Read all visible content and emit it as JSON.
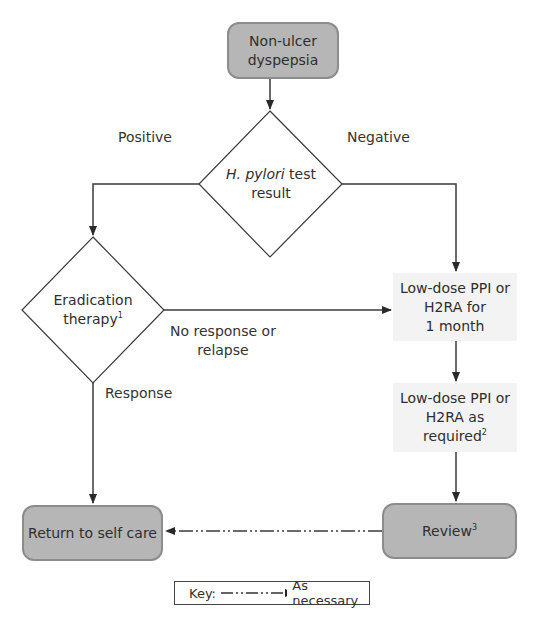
{
  "nodes": {
    "start": {
      "line1": "Non-ulcer",
      "line2": "dyspepsia"
    },
    "hpylori": {
      "italic": "H. pylori",
      "rest": " test",
      "line2": "result"
    },
    "eradication": {
      "line1": "Eradication",
      "line2": "therapy",
      "sup": "1"
    },
    "ppi_month": {
      "line1": "Low-dose PPI or",
      "line2": "H2RA for",
      "line3": "1 month"
    },
    "ppi_required": {
      "line1": "Low-dose PPI or",
      "line2": "H2RA as",
      "line3": "required",
      "sup": "2"
    },
    "return": {
      "label": "Return to self care"
    },
    "review": {
      "label": "Review",
      "sup": "3"
    }
  },
  "edges": {
    "positive": "Positive",
    "negative": "Negative",
    "no_response_line1": "No response or",
    "no_response_line2": "relapse",
    "response": "Response"
  },
  "key": {
    "label": "Key:",
    "meaning": "As necessary"
  },
  "colors": {
    "box_fill": "#b6b6b6",
    "box_border": "#8c8c8c",
    "light_fill": "#f3f3f3",
    "line": "#3a3a3a"
  }
}
